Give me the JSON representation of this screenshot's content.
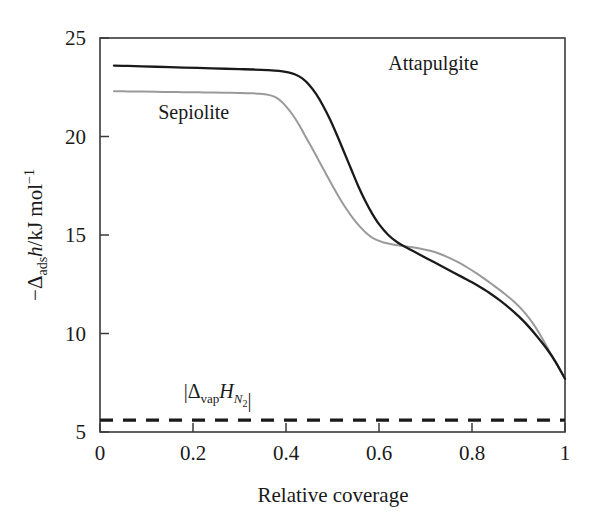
{
  "chart_data": {
    "type": "line",
    "title": "",
    "xlabel": "Relative coverage",
    "ylabel": "-Δadsh/kJ mol⁻¹",
    "xlim": [
      0,
      1
    ],
    "ylim": [
      5,
      25
    ],
    "grid": false,
    "legend_position": "inline-annotations",
    "xticks": [
      "0",
      "0.2",
      "0.4",
      "0.6",
      "0.8",
      "1"
    ],
    "xtick_values": [
      0,
      0.2,
      0.4,
      0.6,
      0.8,
      1
    ],
    "yticks": [
      "5",
      "10",
      "15",
      "20",
      "25"
    ],
    "ytick_values": [
      5,
      10,
      15,
      20,
      25
    ],
    "series": [
      {
        "name": "Attapulgite",
        "color": "#1a1a1a",
        "style": "solid",
        "width": 2.3,
        "label_x": 0.62,
        "label_y": 23.4,
        "x": [
          0.03,
          0.06,
          0.09,
          0.12,
          0.15,
          0.18,
          0.21,
          0.24,
          0.27,
          0.3,
          0.33,
          0.36,
          0.385,
          0.405,
          0.42,
          0.435,
          0.45,
          0.465,
          0.48,
          0.495,
          0.51,
          0.525,
          0.54,
          0.555,
          0.57,
          0.585,
          0.6,
          0.62,
          0.64,
          0.66,
          0.68,
          0.7,
          0.72,
          0.74,
          0.76,
          0.78,
          0.8,
          0.82,
          0.84,
          0.86,
          0.88,
          0.9,
          0.92,
          0.94,
          0.96,
          0.98,
          1.0
        ],
        "y": [
          23.6,
          23.58,
          23.56,
          23.54,
          23.52,
          23.5,
          23.48,
          23.46,
          23.44,
          23.42,
          23.4,
          23.37,
          23.33,
          23.26,
          23.15,
          22.95,
          22.62,
          22.15,
          21.55,
          20.85,
          20.05,
          19.2,
          18.35,
          17.5,
          16.75,
          16.1,
          15.55,
          15.0,
          14.62,
          14.35,
          14.1,
          13.85,
          13.6,
          13.35,
          13.1,
          12.85,
          12.6,
          12.32,
          12.02,
          11.68,
          11.3,
          10.88,
          10.4,
          9.85,
          9.25,
          8.55,
          7.7
        ]
      },
      {
        "name": "Sepiolite",
        "color": "#9a9a9a",
        "style": "solid",
        "width": 2.0,
        "label_x": 0.125,
        "label_y": 20.9,
        "x": [
          0.03,
          0.06,
          0.09,
          0.12,
          0.15,
          0.18,
          0.21,
          0.24,
          0.27,
          0.3,
          0.33,
          0.35,
          0.365,
          0.378,
          0.39,
          0.402,
          0.415,
          0.428,
          0.44,
          0.455,
          0.47,
          0.485,
          0.5,
          0.515,
          0.53,
          0.545,
          0.56,
          0.575,
          0.59,
          0.61,
          0.63,
          0.65,
          0.67,
          0.69,
          0.71,
          0.73,
          0.75,
          0.77,
          0.79,
          0.81,
          0.83,
          0.85,
          0.87,
          0.89,
          0.91,
          0.93,
          0.95,
          0.97,
          1.0
        ],
        "y": [
          22.3,
          22.29,
          22.28,
          22.27,
          22.26,
          22.25,
          22.24,
          22.23,
          22.22,
          22.21,
          22.19,
          22.16,
          22.1,
          21.98,
          21.78,
          21.48,
          21.08,
          20.6,
          20.08,
          19.45,
          18.8,
          18.15,
          17.5,
          16.88,
          16.32,
          15.82,
          15.4,
          15.05,
          14.8,
          14.62,
          14.52,
          14.45,
          14.38,
          14.3,
          14.2,
          14.05,
          13.85,
          13.62,
          13.35,
          13.05,
          12.72,
          12.38,
          12.02,
          11.62,
          11.15,
          10.55,
          9.8,
          8.95,
          7.72
        ]
      }
    ],
    "reference_line": {
      "name": "|ΔvapH(N2)|",
      "value": 5.6,
      "style": "dashed",
      "color": "#1a1a1a",
      "width": 3.2,
      "label_x": 0.18,
      "label_y": 6.75
    }
  },
  "axis": {
    "x_title": "Relative coverage",
    "y_title_parts": {
      "minus": "−",
      "delta": "Δ",
      "ads": "ads",
      "h": "h",
      "unit": "/kJ mol",
      "exp": "−1"
    }
  },
  "annotations": {
    "attapulgite": "Attapulgite",
    "sepiolite": "Sepiolite",
    "vap_bar_open": "|",
    "vap_delta": "Δ",
    "vap_sub": "vap",
    "vap_H": "H",
    "vap_N": "N",
    "vap_N_sub": "2",
    "vap_bar_close": "|"
  },
  "ticks": {
    "x": [
      "0",
      "0.2",
      "0.4",
      "0.6",
      "0.8",
      "1"
    ],
    "y": [
      "5",
      "10",
      "15",
      "20",
      "25"
    ]
  },
  "colors": {
    "attapulgite": "#1a1a1a",
    "sepiolite": "#9a9a9a",
    "frame": "#3a3a3a",
    "background": "#ffffff"
  }
}
